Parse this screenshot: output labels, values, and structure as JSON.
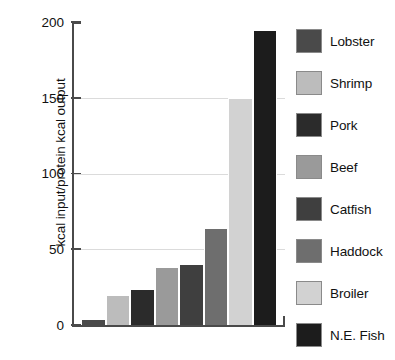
{
  "chart_data": {
    "type": "bar",
    "title": "",
    "xlabel": "",
    "ylabel": "kcal input/protein kcal output",
    "ylim": [
      0,
      200
    ],
    "yticks": [
      0,
      50,
      100,
      150,
      200
    ],
    "ytick_labels": [
      "0",
      "50",
      "100",
      "150",
      "200"
    ],
    "grid": true,
    "legend_position": "right",
    "categories": [
      "Lobster",
      "Shrimp",
      "Pork",
      "Beef",
      "Catfish",
      "Haddock",
      "Broiler",
      "N.E. Fish"
    ],
    "values": [
      4,
      20,
      24,
      38,
      40,
      64,
      150,
      195
    ],
    "colors": [
      "#4a4a4a",
      "#bcbcbc",
      "#2b2b2b",
      "#9a9a9a",
      "#3f3f3f",
      "#6e6e6e",
      "#d2d2d2",
      "#1c1c1c"
    ],
    "series": [
      {
        "name": "kcal input/protein kcal output",
        "values": [
          4,
          20,
          24,
          38,
          40,
          64,
          150,
          195
        ]
      }
    ]
  },
  "legend": {
    "items": [
      {
        "label": "Lobster",
        "color": "#4a4a4a"
      },
      {
        "label": "Shrimp",
        "color": "#bcbcbc"
      },
      {
        "label": "Pork",
        "color": "#2b2b2b"
      },
      {
        "label": "Beef",
        "color": "#9a9a9a"
      },
      {
        "label": "Catfish",
        "color": "#3f3f3f"
      },
      {
        "label": "Haddock",
        "color": "#6e6e6e"
      },
      {
        "label": "Broiler",
        "color": "#d2d2d2"
      },
      {
        "label": "N.E. Fish",
        "color": "#1c1c1c"
      }
    ]
  },
  "axes": {
    "y_label": "kcal input/protein kcal output",
    "y_ticks": [
      "200",
      "150",
      "100",
      "50",
      "0"
    ]
  }
}
